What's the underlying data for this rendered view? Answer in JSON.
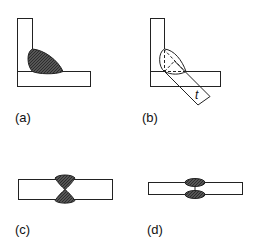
{
  "figure": {
    "panels": [
      {
        "id": "a",
        "label": "(a)",
        "description": "Fillet weld in T/corner joint between vertical and horizontal plates"
      },
      {
        "id": "b",
        "label": "(b)",
        "description": "Fillet weld with dashed inscribed triangle showing throat thickness t"
      },
      {
        "id": "c",
        "label": "(c)",
        "description": "Double-V butt weld, full penetration"
      },
      {
        "id": "d",
        "label": "(d)",
        "description": "Double-sided partial penetration butt weld"
      }
    ],
    "dimension_label": "t"
  },
  "colors": {
    "line": "#222222",
    "weld_fill": "#4a4a4a",
    "background": "#ffffff"
  }
}
